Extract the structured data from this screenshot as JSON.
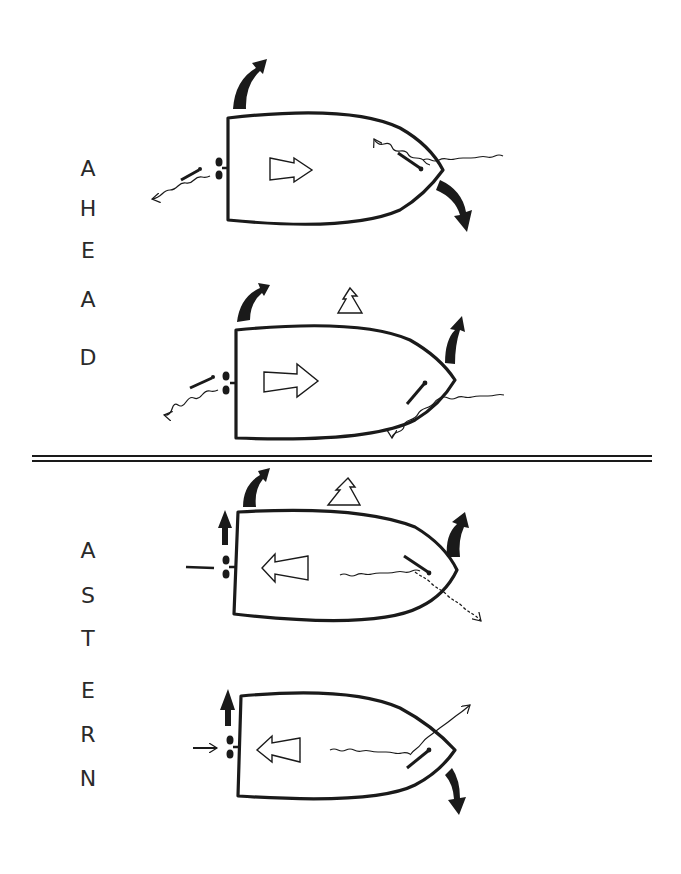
{
  "diagram": {
    "type": "ship-maneuvering-propeller-rudder",
    "sections": [
      {
        "label": "AHEAD",
        "letters": [
          "A",
          "H",
          "E",
          "A",
          "D"
        ],
        "letter_y": [
          168,
          210,
          250,
          300,
          358
        ],
        "cases": [
          {
            "id": "ahead-1",
            "motion": "ahead",
            "bow_swing": "starboard/down",
            "stern_swing": "up",
            "thrust_arrow": "right"
          },
          {
            "id": "ahead-2",
            "motion": "ahead",
            "bow_swing": "up",
            "stern_swing": "up",
            "side_marker": "triangle"
          }
        ]
      },
      {
        "label": "ASTERN",
        "letters": [
          "A",
          "S",
          "T",
          "E",
          "R",
          "N"
        ],
        "letter_y": [
          550,
          595,
          638,
          690,
          735,
          778
        ],
        "cases": [
          {
            "id": "astern-1",
            "motion": "astern",
            "bow_swing": "up",
            "stern_swing": "up",
            "side_marker": "triangle",
            "thrust_arrow": "left"
          },
          {
            "id": "astern-2",
            "motion": "astern",
            "bow_swing": "down",
            "stern_swing": "up",
            "thrust_arrow": "left"
          }
        ]
      }
    ],
    "colors": {
      "ink": "#1a1a1a",
      "background": "#ffffff"
    }
  }
}
